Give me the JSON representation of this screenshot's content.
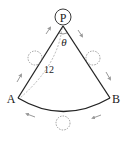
{
  "diagram": {
    "labels": {
      "center": "P",
      "left_point": "A",
      "right_point": "B",
      "angle": "θ",
      "length": "12"
    },
    "colors": {
      "line": "#222222",
      "dashed": "#888888",
      "arrow": "#999999"
    },
    "elements": {
      "sector": "sector with center P, radii PA and PB, arc AB",
      "rolling_circles": 3,
      "arrows": 6
    }
  }
}
